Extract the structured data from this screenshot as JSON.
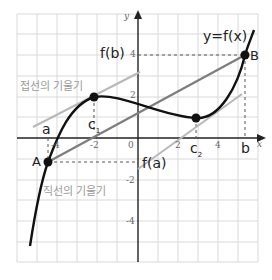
{
  "diagram": {
    "curve_label": "y=f(x)",
    "axis_x_label": "x",
    "axis_y_label": "y",
    "x_ticks": [
      "-4",
      "-2",
      "0",
      "2",
      "4"
    ],
    "y_ticks": [
      "4",
      "2",
      "-2",
      "-4"
    ],
    "points": {
      "A": "A",
      "B": "B",
      "a": "a",
      "b": "b",
      "c1": "c",
      "c1_sub": "1",
      "c2": "c",
      "c2_sub": "2",
      "fa": "f(a)",
      "fb": "f(b)"
    },
    "annotations": {
      "tangent_slope": "접선의 기울기",
      "secant_slope": "직선의 기울기"
    },
    "colors": {
      "curve": "#111111",
      "secant": "#7a7a7a",
      "tangent": "#b5b5b5",
      "grid": "#d8d8d8",
      "axis": "#222222"
    }
  }
}
